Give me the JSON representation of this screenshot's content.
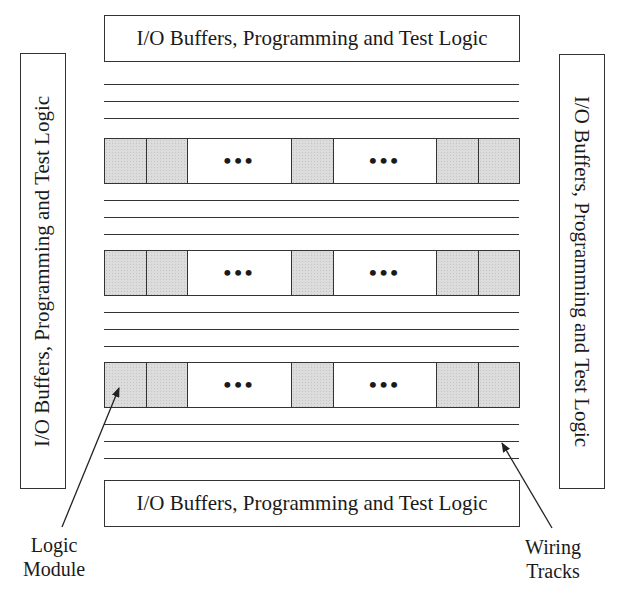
{
  "diagram": {
    "title": "",
    "io_blocks": {
      "top": "I/O Buffers, Programming and Test Logic",
      "bottom": "I/O Buffers, Programming and Test Logic",
      "left": "I/O Buffers, Programming and Test Logic",
      "right": "I/O Buffers, Programming and Test Logic"
    },
    "rows": [
      {
        "cells": [
          "logic",
          "logic",
          "gap",
          "logic",
          "gap",
          "logic",
          "logic"
        ]
      },
      {
        "cells": [
          "logic",
          "logic",
          "gap",
          "logic",
          "gap",
          "logic",
          "logic"
        ]
      },
      {
        "cells": [
          "logic",
          "logic",
          "gap",
          "logic",
          "gap",
          "logic",
          "logic"
        ]
      }
    ],
    "ellipsis": "•••",
    "wiring_track_groups": 4,
    "tracks_per_group": 3,
    "labels": {
      "logic_module_line1": "Logic",
      "logic_module_line2": "Module",
      "wiring_tracks_line1": "Wiring",
      "wiring_tracks_line2": "Tracks"
    },
    "colors": {
      "stroke": "#333333",
      "logic_fill": "#dcdcdc",
      "background": "#ffffff"
    }
  }
}
